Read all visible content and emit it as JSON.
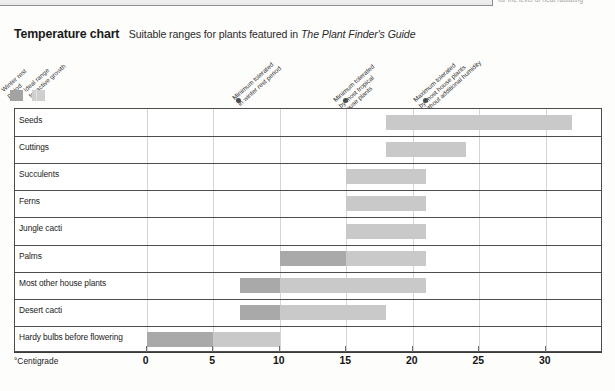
{
  "page_fragments": {
    "top_right_text": "for the level of heat radiating",
    "box_present": true
  },
  "title": {
    "main": "Temperature chart",
    "sub_before": "Suitable ranges for plants featured in",
    "sub_italic": "The Plant Finder's Guide"
  },
  "legend": {
    "items": [
      {
        "label_lines": [
          "Winter rest",
          "period"
        ],
        "swatch": "dark",
        "color": "#a3a3a3"
      },
      {
        "label_lines": [
          "Ideal range",
          "for active growth"
        ],
        "swatch": "light",
        "color": "#cfcfcf"
      }
    ]
  },
  "annotations": [
    {
      "label_lines": [
        "Minimum tolerated",
        "in winter rest period"
      ],
      "value": 7,
      "marker": "dot"
    },
    {
      "label_lines": [
        "Minimum tolerated",
        "by most tropical",
        "house plants"
      ],
      "value": 15,
      "marker": "dot"
    },
    {
      "label_lines": [
        "Maximum tolerated",
        "by most house plants",
        "without additional humidity"
      ],
      "value": 21,
      "marker": "dot"
    }
  ],
  "axis": {
    "name": "°Centigrade",
    "ticks": [
      0,
      5,
      10,
      15,
      20,
      25,
      30
    ],
    "tick_labels": [
      "0",
      "5",
      "10",
      "15",
      "20",
      "25",
      "30"
    ],
    "min": -9.9,
    "max": 34.3
  },
  "chart_data": {
    "type": "bar",
    "orientation": "horizontal",
    "title": "Temperature chart",
    "subtitle": "Suitable ranges for plants featured in The Plant Finder's Guide",
    "xlabel": "°Centigrade",
    "ylabel": "",
    "xlim": [
      -9.9,
      34.3
    ],
    "grid": true,
    "legend_position": "top-left",
    "series": [
      {
        "name": "Winter rest period",
        "color": "#a9a9a9"
      },
      {
        "name": "Ideal range for active growth",
        "color": "#c9c9c9"
      }
    ],
    "categories": [
      "Seeds",
      "Cuttings",
      "Succulents",
      "Ferns",
      "Jungle cacti",
      "Palms",
      "Most other house plants",
      "Desert cacti",
      "Hardy bulbs before flowering"
    ],
    "ranges": [
      {
        "category": "Seeds",
        "winter_rest": null,
        "ideal": [
          18,
          32
        ]
      },
      {
        "category": "Cuttings",
        "winter_rest": null,
        "ideal": [
          18,
          24
        ]
      },
      {
        "category": "Succulents",
        "winter_rest": null,
        "ideal": [
          15,
          21
        ]
      },
      {
        "category": "Ferns",
        "winter_rest": null,
        "ideal": [
          15,
          21
        ]
      },
      {
        "category": "Jungle cacti",
        "winter_rest": null,
        "ideal": [
          15,
          21
        ]
      },
      {
        "category": "Palms",
        "winter_rest": [
          10,
          15
        ],
        "ideal": [
          15,
          21
        ]
      },
      {
        "category": "Most other house plants",
        "winter_rest": [
          7,
          10
        ],
        "ideal": [
          10,
          21
        ]
      },
      {
        "category": "Desert cacti",
        "winter_rest": [
          7,
          10
        ],
        "ideal": [
          10,
          18
        ]
      },
      {
        "category": "Hardy bulbs before flowering",
        "winter_rest": [
          0,
          5
        ],
        "ideal": [
          5,
          10
        ]
      }
    ],
    "reference_markers": [
      {
        "label": "Minimum tolerated in winter rest period",
        "value": 7
      },
      {
        "label": "Minimum tolerated by most tropical house plants",
        "value": 15
      },
      {
        "label": "Maximum tolerated by most house plants without additional humidity",
        "value": 21
      }
    ]
  }
}
